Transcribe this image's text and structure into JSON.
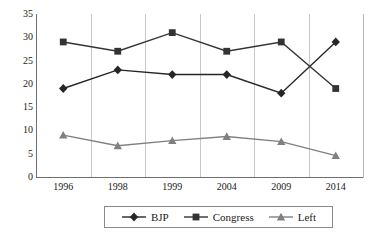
{
  "chart_data": {
    "type": "line",
    "title": "",
    "subtitle": "",
    "xlabel": "",
    "ylabel": "",
    "categories": [
      "1996",
      "1998",
      "1999",
      "2004",
      "2009",
      "2014"
    ],
    "series": [
      {
        "name": "BJP",
        "marker": "diamond",
        "color": "#262626",
        "values": [
          19,
          23,
          22,
          22,
          18,
          29
        ]
      },
      {
        "name": "Congress",
        "marker": "square",
        "color": "#333333",
        "values": [
          29,
          27,
          31,
          27,
          29,
          19
        ]
      },
      {
        "name": "Left",
        "marker": "triangle",
        "color": "#808080",
        "values": [
          9,
          6.7,
          7.8,
          8.7,
          7.6,
          4.6
        ]
      }
    ],
    "ylim": [
      0,
      35
    ],
    "yticks": [
      0,
      5,
      10,
      15,
      20,
      25,
      30,
      35
    ],
    "ytick_labels": [
      "0",
      "5",
      "10",
      "15",
      "20",
      "25",
      "30",
      "35"
    ],
    "grid": "vertical",
    "legend_position": "bottom",
    "legend_entries": [
      "BJP",
      "Congress",
      "Left"
    ]
  },
  "colors": {
    "axis": "#6e6e6e",
    "gridline": "#c8c8c8",
    "text": "#1a1a1a",
    "background": "#ffffff",
    "legend_border": "#8a8a8a"
  }
}
